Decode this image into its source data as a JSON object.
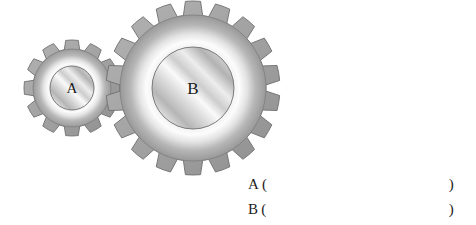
{
  "figure": {
    "background_color": "#ffffff",
    "gear_a": {
      "label": "A",
      "teeth": 12,
      "center_x": 72,
      "center_y": 88,
      "outer_radius": 48,
      "root_radius": 39,
      "rim_outer_radius": 39,
      "hub_radius": 22,
      "tooth_width_deg": 15,
      "body_color": "#9d9d9d",
      "rim_highlight_color": "#f7f7f7",
      "hub_color": "#c9c9c9",
      "outline_color": "#6f6f6f",
      "label_color": "#1a1a1a",
      "label_font_size": 15
    },
    "gear_b": {
      "label": "B",
      "teeth": 18,
      "center_x": 193,
      "center_y": 88,
      "outer_radius": 87,
      "root_radius": 73,
      "rim_outer_radius": 73,
      "hub_radius": 41,
      "tooth_width_deg": 10,
      "body_color": "#9d9d9d",
      "rim_highlight_color": "#f7f7f7",
      "hub_color": "#c9c9c9",
      "outline_color": "#6f6f6f",
      "label_color": "#1a1a1a",
      "label_font_size": 17
    }
  },
  "answers": {
    "rows": [
      {
        "label": "A",
        "paren_open": "(",
        "value": "",
        "paren_close": ")"
      },
      {
        "label": "B",
        "paren_open": "(",
        "value": "",
        "paren_close": ")"
      }
    ]
  }
}
